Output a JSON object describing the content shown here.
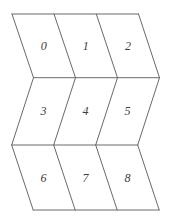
{
  "figure": {
    "type": "parallelogram-grid",
    "rows": 3,
    "cols": 3,
    "cell_labels": [
      "0",
      "1",
      "2",
      "3",
      "4",
      "5",
      "6",
      "7",
      "8"
    ],
    "geometry": {
      "canvas_width": 169,
      "canvas_height": 219,
      "vertex_levels": [
        {
          "y": 14,
          "x": [
            12,
            54,
            96.3,
            138.5
          ]
        },
        {
          "y": 77.7,
          "x": [
            33.5,
            75.5,
            117.5,
            159.5
          ]
        },
        {
          "y": 145,
          "x": [
            11.7,
            53.7,
            95.7,
            137.7
          ]
        },
        {
          "y": 210,
          "x": [
            33.2,
            75.2,
            117.2,
            159.2
          ]
        }
      ]
    },
    "style": {
      "line_color": "#6a6a6a",
      "line_width": 1,
      "label_color": "#3c3c3c",
      "background_color": "#ffffff"
    }
  }
}
